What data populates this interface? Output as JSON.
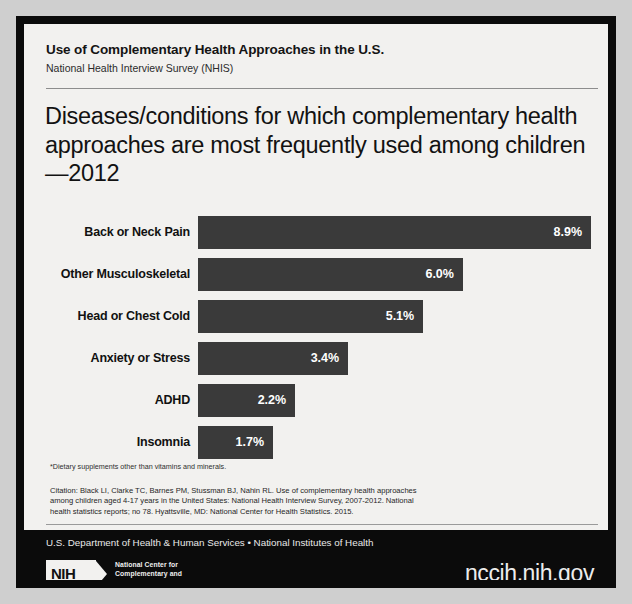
{
  "header": {
    "title": "Use of Complementary Health Approaches in the U.S.",
    "subtitle": "National Health Interview Survey (NHIS)"
  },
  "main_title": "Diseases/conditions for which complementary health approaches are most frequently used among children—2012",
  "chart_data": {
    "type": "bar",
    "orientation": "horizontal",
    "title": "Diseases/conditions for which complementary health approaches are most frequently used among children—2012",
    "xlabel": "",
    "ylabel": "",
    "categories": [
      "Back or Neck Pain",
      "Other Musculoskeletal",
      "Head or Chest Cold",
      "Anxiety or Stress",
      "ADHD",
      "Insomnia"
    ],
    "values": [
      8.9,
      6.0,
      5.1,
      3.4,
      2.2,
      1.7
    ],
    "value_labels": [
      "8.9%",
      "6.0%",
      "5.1%",
      "3.4%",
      "2.2%",
      "1.7%"
    ],
    "xlim": [
      0,
      8.9
    ],
    "grid": false,
    "legend": false,
    "bar_color": "#3a3a3a",
    "value_label_color": "#ffffff"
  },
  "footnote": "*Dietary supplements other than vitamins and minerals.",
  "citation": {
    "line1": "Citation: Black LI, Clarke TC, Barnes PM, Stussman BJ, Nahin RL. Use of complementary health approaches",
    "line2": "among children aged 4-17 years in the United States: National Health Interview Survey, 2007-2012. National",
    "line3": "health statistics reports; no 78. Hyattsville, MD: National Center for Health Statistics. 2015."
  },
  "footer": {
    "agency": "U.S. Department of Health & Human Services • National Institutes of Health",
    "logo_mark": "NIH",
    "logo_line1": "National Center for",
    "logo_line2": "Complementary and",
    "logo_line3": "Integrative Health",
    "url": "nccih.nih.gov"
  },
  "colors": {
    "frame": "#0b0b0b",
    "card": "#f2f1ef",
    "bar": "#3a3a3a",
    "rule": "#8d8d8d"
  }
}
